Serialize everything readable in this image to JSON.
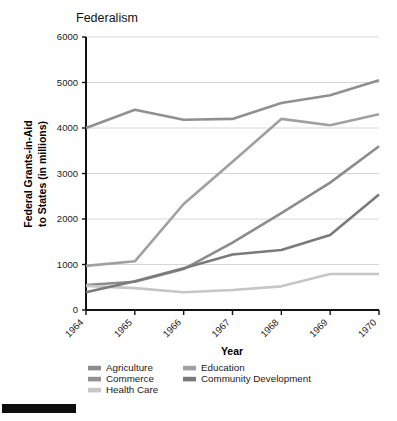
{
  "figure": {
    "title": "Federalism",
    "background_color": "#ffffff",
    "black_bar_present": true
  },
  "chart_data": {
    "type": "line",
    "title": "Federalism",
    "xlabel": "Year",
    "ylabel": "Federal Grants-in-Aid to States (in millions)",
    "ylabel_line1": "Federal Grants-in-Aid",
    "ylabel_line2": "to States (in millions)",
    "categories": [
      "1964",
      "1965",
      "1966",
      "1967",
      "1968",
      "1969",
      "1970"
    ],
    "x": [
      1964,
      1965,
      1966,
      1967,
      1968,
      1969,
      1970
    ],
    "xlim": [
      1964,
      1970
    ],
    "ylim": [
      0,
      6000
    ],
    "yticks": [
      0,
      1000,
      2000,
      3000,
      4000,
      5000,
      6000
    ],
    "ytick_labels": [
      "0",
      "1000",
      "2000",
      "3000",
      "4000",
      "5000",
      "6000"
    ],
    "xtick_labels": [
      "1964",
      "1965",
      "1966",
      "1967",
      "1968",
      "1969",
      "1970"
    ],
    "grid": "horizontal",
    "legend_position": "below-axis",
    "legend_columns": 2,
    "series": [
      {
        "name": "Agriculture",
        "color": "#8c8c8c",
        "values": [
          550,
          620,
          900,
          1480,
          2130,
          2800,
          3600
        ]
      },
      {
        "name": "Commerce",
        "color": "#909090",
        "values": [
          4000,
          4400,
          4180,
          4200,
          4550,
          4720,
          5050
        ]
      },
      {
        "name": "Health Care",
        "color": "#c6c6c6",
        "values": [
          530,
          480,
          390,
          440,
          520,
          790,
          790
        ]
      },
      {
        "name": "Education",
        "color": "#a0a0a0",
        "values": [
          970,
          1070,
          2330,
          3260,
          4200,
          4060,
          4300
        ]
      },
      {
        "name": "Community Development",
        "color": "#7a7a7a",
        "values": [
          390,
          630,
          920,
          1220,
          1320,
          1650,
          2540
        ]
      }
    ]
  },
  "legend": {
    "column1": [
      {
        "label": "Agriculture",
        "color": "#8c8c8c"
      },
      {
        "label": "Commerce",
        "color": "#909090"
      },
      {
        "label": "Health Care",
        "color": "#c6c6c6"
      }
    ],
    "column2": [
      {
        "label": "Education",
        "color": "#a0a0a0"
      },
      {
        "label": "Community Development",
        "color": "#7a7a7a"
      }
    ]
  }
}
